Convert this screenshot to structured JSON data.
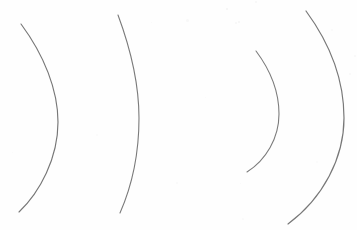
{
  "figure": {
    "width": 357,
    "height": 230,
    "background_color": "#fefefe",
    "stroke_color": "#7a7a7a",
    "speck_color": "#e8e8e8"
  },
  "chart_data": {
    "type": "line",
    "subtitle": "",
    "xlabel": "",
    "ylabel": "",
    "xlim": [
      0,
      357
    ],
    "ylim": [
      0,
      230
    ],
    "grid": false,
    "legend": "none",
    "axes_visible": false,
    "tick_labels": {
      "x": [],
      "y": []
    },
    "annotations": [],
    "series": [
      {
        "name": "arc-1",
        "stroke": "#777777",
        "stroke_width": 1.15,
        "orientation": "convex-right",
        "start": [
          21,
          24
        ],
        "end": [
          19,
          212
        ],
        "apex": [
          58,
          120
        ],
        "path": "M 21 24 C 44 55, 58 90, 58 122 C 58 158, 40 192, 19 212",
        "points_x": [
          21,
          33,
          45,
          54,
          58,
          57,
          50,
          38,
          27,
          19
        ],
        "points_y": [
          24,
          42,
          65,
          92,
          122,
          148,
          172,
          192,
          204,
          212
        ]
      },
      {
        "name": "arc-2",
        "stroke": "#7a7a7a",
        "stroke_width": 1.1,
        "orientation": "convex-right",
        "start": [
          118,
          15
        ],
        "end": [
          120,
          213
        ],
        "apex": [
          139,
          118
        ],
        "path": "M 118 15 C 131 50, 139 86, 139 118 C 139 155, 131 188, 120 213",
        "points_x": [
          118,
          126,
          133,
          137,
          139,
          139,
          136,
          130,
          125,
          120
        ],
        "points_y": [
          15,
          40,
          66,
          92,
          118,
          146,
          170,
          190,
          203,
          213
        ]
      },
      {
        "name": "arc-3",
        "stroke": "#7c7c7c",
        "stroke_width": 1.1,
        "orientation": "convex-right",
        "start": [
          256,
          51
        ],
        "end": [
          247,
          172
        ],
        "apex": [
          279,
          115
        ],
        "path": "M 256 51 C 271 71, 279 93, 279 114 C 279 138, 266 160, 247 172",
        "points_x": [
          256,
          265,
          273,
          277,
          279,
          277,
          270,
          260,
          252,
          247
        ],
        "points_y": [
          51,
          64,
          80,
          97,
          114,
          133,
          150,
          162,
          168,
          172
        ]
      },
      {
        "name": "arc-4",
        "stroke": "#787878",
        "stroke_width": 1.2,
        "orientation": "convex-right",
        "start": [
          306,
          11
        ],
        "end": [
          288,
          224
        ],
        "apex": [
          344,
          116
        ],
        "path": "M 306 11 C 331 45, 344 82, 344 118 C 344 158, 323 198, 288 224",
        "points_x": [
          306,
          322,
          335,
          341,
          344,
          342,
          333,
          318,
          302,
          288
        ],
        "points_y": [
          11,
          34,
          60,
          89,
          118,
          150,
          178,
          200,
          214,
          224
        ]
      }
    ]
  },
  "specks": [
    {
      "x": 226,
      "y": 8,
      "size": 2.0,
      "opacity": 0.45
    },
    {
      "x": 235,
      "y": 22,
      "size": 1.5,
      "opacity": 0.35
    },
    {
      "x": 238,
      "y": 21,
      "size": 2.2,
      "opacity": 0.4
    },
    {
      "x": 186,
      "y": 19,
      "size": 3.0,
      "opacity": 0.25
    },
    {
      "x": 255,
      "y": 1,
      "size": 1.6,
      "opacity": 0.3
    },
    {
      "x": 151,
      "y": 22,
      "size": 1.4,
      "opacity": 0.22
    },
    {
      "x": 354,
      "y": 55,
      "size": 2.0,
      "opacity": 0.3
    },
    {
      "x": 349,
      "y": 73,
      "size": 1.6,
      "opacity": 0.25
    },
    {
      "x": 331,
      "y": 29,
      "size": 1.5,
      "opacity": 0.2
    },
    {
      "x": 176,
      "y": 182,
      "size": 1.6,
      "opacity": 0.22
    },
    {
      "x": 242,
      "y": 218,
      "size": 1.8,
      "opacity": 0.22
    },
    {
      "x": 240,
      "y": 183,
      "size": 1.4,
      "opacity": 0.2
    },
    {
      "x": 96,
      "y": 134,
      "size": 1.5,
      "opacity": 0.18
    },
    {
      "x": 205,
      "y": 97,
      "size": 1.4,
      "opacity": 0.18
    },
    {
      "x": 316,
      "y": 161,
      "size": 1.5,
      "opacity": 0.18
    },
    {
      "x": 12,
      "y": 152,
      "size": 1.4,
      "opacity": 0.16
    }
  ]
}
